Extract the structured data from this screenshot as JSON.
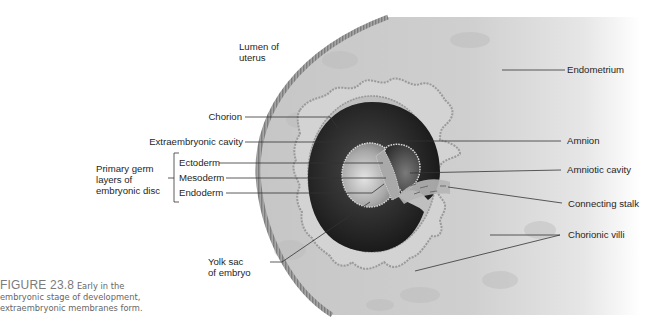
{
  "figure": {
    "number_label": "FIGURE 23.8",
    "caption_line1": "Early in the",
    "caption_line2": "embryonic stage of development,",
    "caption_line3": "extraembryonic membranes form."
  },
  "labels": {
    "lumen_line1": "Lumen of",
    "lumen_line2": "uterus",
    "endometrium": "Endometrium",
    "chorion": "Chorion",
    "extraembryonic_cavity": "Extraembryonic cavity",
    "primary_germ_line1": "Primary germ",
    "primary_germ_line2": "layers of",
    "primary_germ_line3": "embryonic disc",
    "ectoderm": "Ectoderm",
    "mesoderm": "Mesoderm",
    "endoderm": "Endoderm",
    "amnion": "Amnion",
    "amniotic_cavity": "Amniotic cavity",
    "connecting_stalk": "Connecting stalk",
    "chorionic_villi": "Chorionic villi",
    "yolk_sac_line1": "Yolk sac",
    "yolk_sac_line2": "of embryo"
  },
  "colors": {
    "tissue": "#c9c9c9",
    "wall": "#9a9a9a",
    "dark_cavity": "#2a2a2a",
    "leader": "#333333"
  }
}
